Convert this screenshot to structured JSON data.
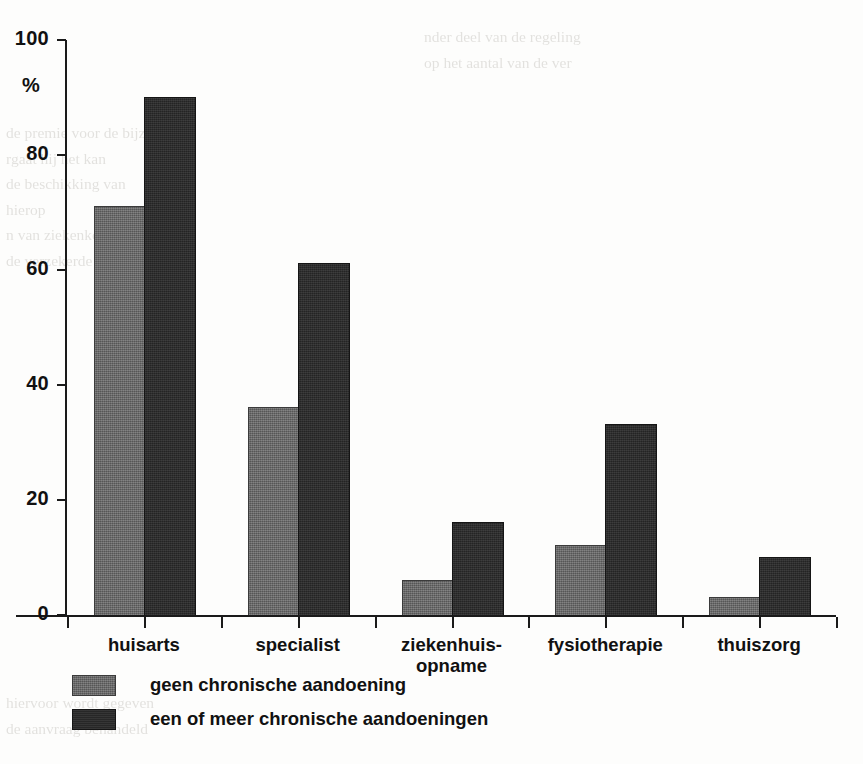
{
  "chart_data": {
    "type": "bar",
    "title": "",
    "subtitle": "",
    "xlabel": "",
    "ylabel": "%",
    "ylim": [
      0,
      100
    ],
    "yticks": [
      0,
      20,
      40,
      60,
      80,
      100
    ],
    "ytick_labels": [
      "0",
      "20",
      "40",
      "60",
      "80",
      "100"
    ],
    "grid": false,
    "legend_position": "below-left",
    "categories": [
      "huisarts",
      "ziekenhuis-\nopname",
      "specialist",
      "fysiotherapie",
      "thuiszorg"
    ],
    "category_lines": [
      [
        "huisarts"
      ],
      [
        "specialist"
      ],
      [
        "ziekenhuis-",
        "opname"
      ],
      [
        "fysiotherapie"
      ],
      [
        "thuiszorg"
      ]
    ],
    "series": [
      {
        "name": "geen chronische aandoening",
        "color": "#696969",
        "values": [
          71,
          36,
          6,
          12,
          3
        ]
      },
      {
        "name": "een of meer chronische aandoeningen",
        "color": "#2b2b2b",
        "values": [
          90,
          61,
          16,
          33,
          10
        ]
      }
    ]
  },
  "axis": {
    "y_unit_label": "%"
  },
  "bleed_text": {
    "right_column": [
      "nder deel van de regeling",
      "op het aantal van de ver"
    ],
    "left_column": [
      "de premie voor de bijzonder",
      "rgaat hij het kan",
      "de beschikking van",
      "hierop",
      "n van ziekenkostenver",
      "de verzekerde"
    ],
    "bottom": [
      "hiervoor wordt gegeven",
      "de aanvraag behandeld"
    ]
  }
}
